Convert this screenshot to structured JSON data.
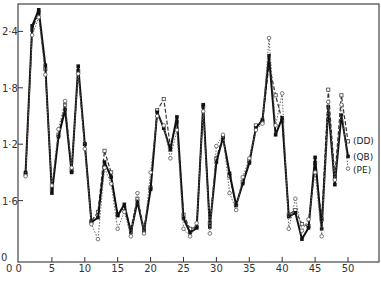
{
  "chart_data": {
    "type": "line",
    "title": "",
    "xlabel": "",
    "ylabel": "",
    "xlim": [
      0,
      55
    ],
    "ylim": [
      0,
      2.7
    ],
    "grid": false,
    "legend_position": "right, at line ends",
    "x_ticks": [
      0,
      5,
      10,
      15,
      20,
      25,
      30,
      35,
      40,
      45,
      50
    ],
    "x_tick_labels": [
      "0 0",
      "5",
      "10",
      "15",
      "20",
      "25",
      "30",
      "35",
      "40",
      "45",
      "50"
    ],
    "y_ticks": [
      0,
      0.6,
      1.2,
      1.8,
      2.4
    ],
    "y_tick_labels": [
      "0",
      "1·6",
      "1·2",
      "1·8",
      "2·4"
    ],
    "x": [
      1,
      2,
      3,
      4,
      5,
      6,
      7,
      8,
      9,
      10,
      11,
      12,
      13,
      14,
      15,
      16,
      17,
      18,
      19,
      20,
      21,
      22,
      23,
      24,
      25,
      26,
      27,
      28,
      29,
      30,
      31,
      32,
      33,
      34,
      35,
      36,
      37,
      38,
      39,
      40,
      41,
      42,
      43,
      44,
      45,
      46,
      47,
      48,
      49,
      50
    ],
    "series": [
      {
        "name": "(DD)",
        "marker": "open-square",
        "style": "dashed",
        "values": [
          0.88,
          2.42,
          2.6,
          2.0,
          0.72,
          1.3,
          1.62,
          0.92,
          1.98,
          1.2,
          0.38,
          0.48,
          1.13,
          0.9,
          0.45,
          0.52,
          0.3,
          0.62,
          0.3,
          0.74,
          1.56,
          1.68,
          1.18,
          1.44,
          0.45,
          0.3,
          0.32,
          1.6,
          0.36,
          1.05,
          1.28,
          0.86,
          0.55,
          0.8,
          1.02,
          1.4,
          1.44,
          2.05,
          1.72,
          1.45,
          0.45,
          0.5,
          0.35,
          0.33,
          1.0,
          0.4,
          1.78,
          0.85,
          1.72,
          1.23
        ]
      },
      {
        "name": "(QB)",
        "marker": "filled-square",
        "style": "solid",
        "values": [
          0.9,
          2.46,
          2.63,
          2.04,
          0.68,
          1.28,
          1.57,
          0.9,
          2.03,
          1.2,
          0.37,
          0.42,
          1.01,
          0.85,
          0.44,
          0.56,
          0.26,
          0.59,
          0.27,
          0.72,
          1.54,
          1.37,
          1.14,
          1.49,
          0.41,
          0.26,
          0.31,
          1.62,
          0.32,
          1.01,
          1.27,
          0.89,
          0.55,
          0.78,
          1.0,
          1.37,
          1.46,
          2.14,
          1.3,
          1.48,
          0.43,
          0.47,
          0.19,
          0.31,
          1.06,
          0.3,
          1.6,
          0.77,
          1.51,
          1.07
        ]
      },
      {
        "name": "(PE)",
        "marker": "open-circle",
        "style": "dotted",
        "values": [
          0.86,
          2.36,
          2.55,
          1.94,
          0.76,
          1.36,
          1.66,
          0.95,
          1.95,
          1.15,
          0.35,
          0.19,
          0.95,
          0.78,
          0.3,
          0.48,
          0.22,
          0.68,
          0.25,
          0.9,
          1.5,
          1.4,
          1.05,
          1.35,
          0.3,
          0.22,
          0.36,
          1.55,
          0.25,
          1.18,
          1.3,
          0.68,
          0.5,
          0.85,
          1.05,
          1.35,
          1.42,
          2.33,
          1.4,
          1.74,
          0.3,
          0.62,
          0.28,
          0.4,
          0.9,
          0.22,
          1.65,
          0.82,
          1.62,
          0.94
        ]
      }
    ]
  }
}
